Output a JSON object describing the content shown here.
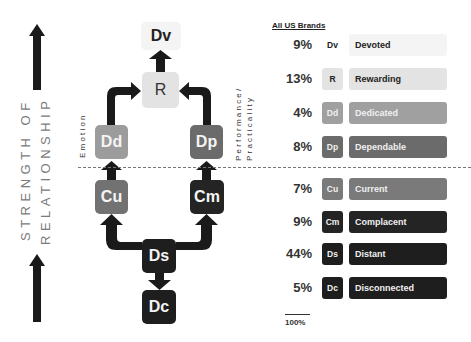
{
  "axis_label": {
    "line1": "STRENGTH OF",
    "line2": "RELATIONSHIP"
  },
  "side_labels": {
    "left": "Emotion",
    "right_line1": "Performance/",
    "right_line2": "Practicality"
  },
  "nodes": {
    "Dv": {
      "label": "Dv",
      "bg": "#f4f4f4",
      "fg": "#222222"
    },
    "R": {
      "label": "R",
      "bg": "#e3e3e3",
      "fg": "#333333"
    },
    "Dd": {
      "label": "Dd",
      "bg": "#9c9c9c",
      "fg": "#f4f4f4"
    },
    "Dp": {
      "label": "Dp",
      "bg": "#6b6b6b",
      "fg": "#f4f4f4"
    },
    "Cu": {
      "label": "Cu",
      "bg": "#727272",
      "fg": "#f4f4f4"
    },
    "Cm": {
      "label": "Cm",
      "bg": "#242424",
      "fg": "#f4f4f4"
    },
    "Ds": {
      "label": "Ds",
      "bg": "#1e1e1e",
      "fg": "#f4f4f4"
    },
    "Dc": {
      "label": "Dc",
      "bg": "#1e1e1e",
      "fg": "#f4f4f4"
    }
  },
  "table": {
    "header": "All US Brands",
    "rows": [
      {
        "pct": "9%",
        "code": "Dv",
        "name": "Devoted",
        "bg": "#f4f4f4",
        "fg": "#222222",
        "badge_bg": "#ffffff"
      },
      {
        "pct": "13%",
        "code": "R",
        "name": "Rewarding",
        "bg": "#e3e3e3",
        "fg": "#222222",
        "badge_bg": "#e3e3e3"
      },
      {
        "pct": "4%",
        "code": "Dd",
        "name": "Dedicated",
        "bg": "#a0a0a0",
        "fg": "#f0f0f0",
        "badge_bg": "#a0a0a0"
      },
      {
        "pct": "8%",
        "code": "Dp",
        "name": "Dependable",
        "bg": "#6b6b6b",
        "fg": "#f0f0f0",
        "badge_bg": "#6b6b6b"
      },
      {
        "pct": "7%",
        "code": "Cu",
        "name": "Current",
        "bg": "#7a7a7a",
        "fg": "#f0f0f0",
        "badge_bg": "#7a7a7a"
      },
      {
        "pct": "9%",
        "code": "Cm",
        "name": "Complacent",
        "bg": "#242424",
        "fg": "#f0f0f0",
        "badge_bg": "#242424"
      },
      {
        "pct": "44%",
        "code": "Ds",
        "name": "Distant",
        "bg": "#1e1e1e",
        "fg": "#f0f0f0",
        "badge_bg": "#1e1e1e"
      },
      {
        "pct": "5%",
        "code": "Dc",
        "name": "Disconnected",
        "bg": "#1e1e1e",
        "fg": "#f0f0f0",
        "badge_bg": "#1e1e1e"
      }
    ],
    "total": "100%"
  }
}
